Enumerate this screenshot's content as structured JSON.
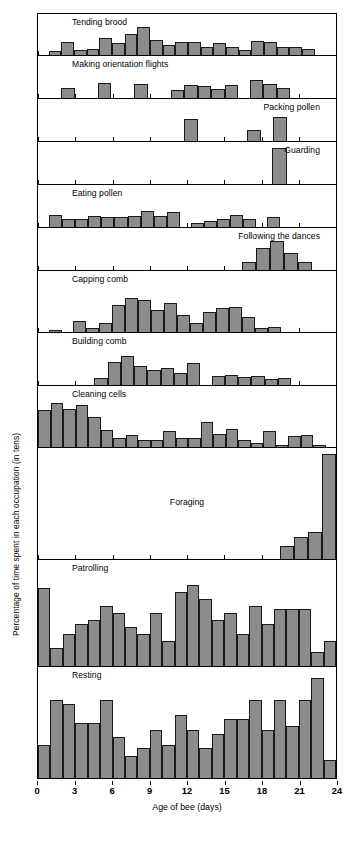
{
  "chart_data": {
    "type": "bar",
    "title": "",
    "subtitle": "",
    "xlabel": "Age of bee (days)",
    "ylabel": "Percentage of time spent in each occupation (in tens)",
    "grid": false,
    "legend": "none",
    "bar_color": "#8c8c8c",
    "bar_edge_color": "#1a1a1a",
    "xlim": [
      0,
      24
    ],
    "x": [
      0,
      1,
      2,
      3,
      4,
      5,
      6,
      7,
      8,
      9,
      10,
      11,
      12,
      13,
      14,
      15,
      16,
      17,
      18,
      19,
      20,
      21,
      22,
      23
    ],
    "xtick_labels": [
      "0",
      "3",
      "6",
      "9",
      "12",
      "15",
      "18",
      "21",
      "24"
    ],
    "xtick_values": [
      0,
      3,
      6,
      9,
      12,
      15,
      18,
      21,
      24
    ],
    "note": "24 age bins (day 0 through day 23); each panel is a separate small-multiple histogram sharing the same x axis.",
    "panels": [
      {
        "name": "Tending brood",
        "label_align": "left",
        "ymax": 3,
        "values": [
          0,
          0.3,
          0.9,
          0.35,
          0.45,
          1.2,
          0.85,
          1.5,
          2.0,
          1.1,
          0.75,
          0.95,
          0.9,
          0.6,
          0.85,
          0.55,
          0.35,
          1.0,
          0.95,
          0.6,
          0.6,
          0.45,
          0,
          0
        ]
      },
      {
        "name": "Making orientation flights",
        "label_align": "left",
        "ymax": 3,
        "values": [
          0,
          0,
          0.75,
          0,
          0,
          1.1,
          0,
          0,
          1.0,
          0,
          0,
          0.55,
          0.9,
          0.85,
          0.65,
          0.9,
          0,
          1.3,
          1.0,
          0.7,
          0,
          0,
          0,
          0
        ]
      },
      {
        "name": "Packing pollen",
        "label_align": "right",
        "ymax": 3,
        "values": [
          0,
          0,
          0,
          0,
          0,
          0,
          0,
          0,
          0,
          0,
          0,
          0,
          1.6,
          0,
          0,
          0,
          0,
          0.8,
          0,
          1.7,
          0,
          0,
          0,
          0
        ]
      },
      {
        "name": "Guarding",
        "label_align": "right",
        "ymax": 3,
        "values": [
          0,
          0,
          0,
          0,
          0,
          0,
          0,
          0,
          0,
          0,
          0,
          0,
          0,
          0,
          0,
          0,
          0,
          0,
          0,
          2.6,
          0,
          0,
          0,
          0
        ]
      },
      {
        "name": "Eating pollen",
        "label_align": "left",
        "ymax": 3,
        "values": [
          0,
          0.85,
          0.6,
          0.6,
          0.8,
          0.75,
          0.75,
          0.8,
          1.15,
          0.8,
          1.1,
          0,
          0.3,
          0.45,
          0.6,
          0.85,
          0.55,
          0,
          0.7,
          0,
          0,
          0,
          0,
          0
        ]
      },
      {
        "name": "Following the dances",
        "label_align": "right",
        "ymax": 3,
        "values": [
          0,
          0,
          0,
          0,
          0,
          0,
          0,
          0,
          0,
          0,
          0,
          0,
          0,
          0,
          0,
          0,
          0,
          0.55,
          1.6,
          2.1,
          1.2,
          0.6,
          0,
          0
        ]
      },
      {
        "name": "Capping comb",
        "label_align": "left",
        "ymax": 10,
        "values": [
          0,
          0.3,
          0,
          1.8,
          0.6,
          1.5,
          4.4,
          5.6,
          5.3,
          3.6,
          4.8,
          2.8,
          1.5,
          3.3,
          3.9,
          4.1,
          2.5,
          0.7,
          0.8,
          0,
          0,
          0,
          0,
          0
        ]
      },
      {
        "name": "Building comb",
        "label_align": "left",
        "ymax": 10,
        "values": [
          0,
          0,
          0,
          0,
          0,
          1.4,
          4.4,
          5.6,
          3.7,
          2.8,
          3.2,
          2.4,
          4.2,
          0,
          1.8,
          2.0,
          1.6,
          1.8,
          1.1,
          1.3,
          0,
          0,
          0,
          0
        ]
      },
      {
        "name": "Cleaning cells",
        "label_align": "left",
        "ymax": 10,
        "values": [
          6.0,
          7.2,
          6.3,
          6.9,
          5.0,
          2.8,
          1.5,
          2.0,
          1.1,
          1.1,
          2.6,
          1.4,
          1.4,
          4.1,
          2.2,
          3.0,
          1.2,
          0.7,
          2.6,
          0.35,
          1.8,
          1.9,
          0.25,
          0
        ]
      },
      {
        "name": "Foraging",
        "label_align": "center",
        "ymax": 100,
        "values": [
          0,
          0,
          0,
          0,
          0,
          0,
          0,
          0,
          0,
          0,
          0,
          0,
          0,
          0,
          0,
          0,
          0,
          0,
          0,
          0,
          12,
          20,
          24,
          95
        ]
      },
      {
        "name": "Patrolling",
        "label_align": "left",
        "ymax": 30,
        "values": [
          22,
          5,
          9,
          12,
          13,
          17,
          15,
          11,
          9,
          15,
          7,
          21,
          23,
          19,
          13,
          15,
          9,
          17,
          12,
          16,
          16,
          16,
          4,
          7
        ]
      },
      {
        "name": "Resting",
        "label_align": "left",
        "ymax": 30,
        "values": [
          9,
          21,
          20,
          15,
          15,
          21,
          11,
          6,
          8,
          13,
          9,
          17,
          13,
          8,
          12,
          16,
          16,
          21,
          13,
          21,
          14,
          21,
          27,
          5
        ]
      }
    ]
  }
}
